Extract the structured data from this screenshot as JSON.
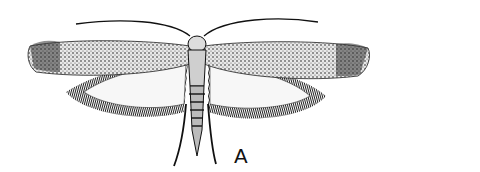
{
  "figure": {
    "label": "A",
    "colors": {
      "ink": "#111111",
      "background": "#ffffff",
      "wing_light": "#f4f4f4",
      "wing_mid": "#9a9a9a"
    }
  }
}
